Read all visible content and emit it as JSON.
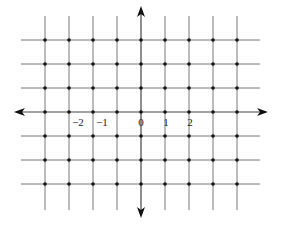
{
  "diagram": {
    "type": "integer lattice grid",
    "grid": {
      "x_lines_px": [
        45,
        69,
        93,
        117,
        141,
        165,
        189,
        213,
        237
      ],
      "y_lines_px": [
        40,
        64,
        88,
        112,
        136,
        160,
        184
      ],
      "v_line_top": 16,
      "v_line_bottom": 210,
      "h_line_left": 21,
      "h_line_right": 260
    },
    "axes": {
      "origin_px": [
        141,
        112
      ],
      "x_axis": {
        "left_arrow_x": 14,
        "right_arrow_x": 268
      },
      "y_axis": {
        "top_arrow_y": 6,
        "bottom_arrow_y": 218
      }
    },
    "tick_labels": [
      {
        "text": "−2",
        "x": 78,
        "y": 123
      },
      {
        "text": "−1",
        "x": 102,
        "y": 123
      },
      {
        "text": "0",
        "x": 141,
        "y": 123
      },
      {
        "text": "1",
        "x": 166,
        "y": 123
      },
      {
        "text": "2",
        "x": 190,
        "y": 123
      }
    ],
    "colors": {
      "line": "#777777",
      "axis": "#444444",
      "dot": "#111111"
    }
  }
}
